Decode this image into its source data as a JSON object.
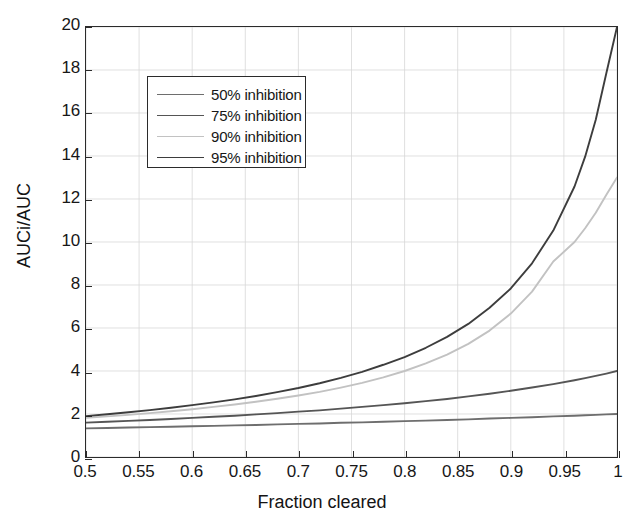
{
  "chart_data": {
    "type": "line",
    "title": "",
    "xlabel": "Fraction cleared",
    "ylabel": "AUCi/AUC",
    "xlim": [
      0.5,
      1.0
    ],
    "ylim": [
      0,
      20
    ],
    "grid": true,
    "legend_position": "upper-left-inside",
    "xticks": [
      "0.5",
      "0.55",
      "0.6",
      "0.65",
      "0.7",
      "0.75",
      "0.8",
      "0.85",
      "0.9",
      "0.95",
      "1"
    ],
    "xtick_values": [
      0.5,
      0.55,
      0.6,
      0.65,
      0.7,
      0.75,
      0.8,
      0.85,
      0.9,
      0.95,
      1.0
    ],
    "yticks": [
      "0",
      "2",
      "4",
      "6",
      "8",
      "10",
      "12",
      "14",
      "16",
      "18",
      "20"
    ],
    "ytick_values": [
      0,
      2,
      4,
      6,
      8,
      10,
      12,
      14,
      16,
      18,
      20
    ],
    "x": [
      0.5,
      0.52,
      0.54,
      0.56,
      0.58,
      0.6,
      0.62,
      0.64,
      0.66,
      0.68,
      0.7,
      0.72,
      0.74,
      0.76,
      0.78,
      0.8,
      0.82,
      0.84,
      0.86,
      0.88,
      0.9,
      0.92,
      0.94,
      0.96,
      0.97,
      0.98,
      0.99,
      1.0
    ],
    "series": [
      {
        "name": "50% inhibition",
        "inhibition": 0.5,
        "color": "#6e6e6e",
        "values": [
          1.33,
          1.35,
          1.37,
          1.39,
          1.41,
          1.43,
          1.45,
          1.47,
          1.49,
          1.52,
          1.54,
          1.56,
          1.59,
          1.61,
          1.64,
          1.67,
          1.69,
          1.72,
          1.75,
          1.79,
          1.82,
          1.85,
          1.89,
          1.92,
          1.94,
          1.96,
          1.98,
          2.0
        ]
      },
      {
        "name": "75% inhibition",
        "inhibition": 0.75,
        "color": "#555555",
        "values": [
          1.6,
          1.64,
          1.68,
          1.72,
          1.77,
          1.82,
          1.87,
          1.92,
          1.98,
          2.04,
          2.11,
          2.17,
          2.25,
          2.33,
          2.41,
          2.5,
          2.6,
          2.7,
          2.82,
          2.94,
          3.08,
          3.23,
          3.39,
          3.57,
          3.67,
          3.77,
          3.88,
          4.0
        ]
      },
      {
        "name": "90% inhibition",
        "inhibition": 0.9,
        "color": "#c2c2c2",
        "values": [
          1.82,
          1.89,
          1.96,
          2.04,
          2.13,
          2.22,
          2.33,
          2.44,
          2.57,
          2.71,
          2.86,
          3.03,
          3.23,
          3.45,
          3.7,
          4.0,
          4.35,
          4.76,
          5.26,
          5.88,
          6.67,
          7.69,
          9.09,
          10.0,
          10.64,
          11.36,
          12.2,
          13.0
        ]
      },
      {
        "name": "95% inhibition",
        "inhibition": 0.95,
        "color": "#3d3d3d",
        "values": [
          1.9,
          1.99,
          2.08,
          2.18,
          2.29,
          2.41,
          2.54,
          2.68,
          2.84,
          3.02,
          3.21,
          3.43,
          3.68,
          3.96,
          4.29,
          4.65,
          5.08,
          5.59,
          6.19,
          6.94,
          7.84,
          9.01,
          10.53,
          12.58,
          13.97,
          15.69,
          17.86,
          20.0
        ]
      }
    ]
  }
}
